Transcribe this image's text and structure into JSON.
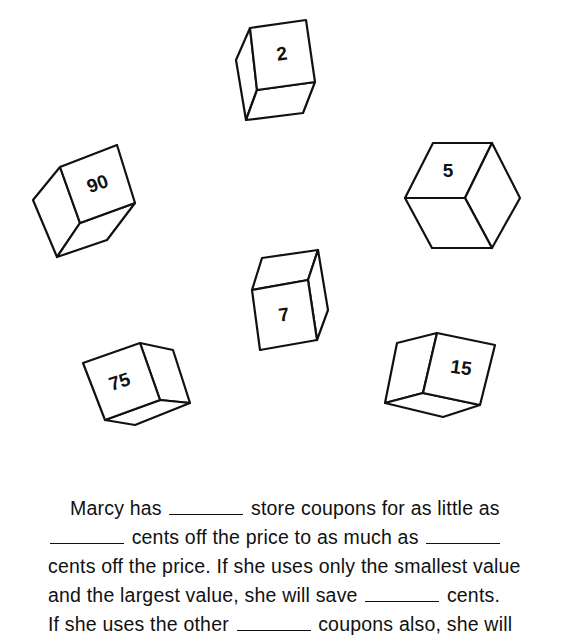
{
  "worksheet": {
    "coupon_cubes": [
      {
        "id": "cube-2",
        "value": "2"
      },
      {
        "id": "cube-90",
        "value": "90"
      },
      {
        "id": "cube-5",
        "value": "5"
      },
      {
        "id": "cube-7",
        "value": "7"
      },
      {
        "id": "cube-75",
        "value": "75"
      },
      {
        "id": "cube-15",
        "value": "15"
      }
    ],
    "passage": {
      "line1": {
        "a": "Marcy has",
        "b": "store coupons for as little as"
      },
      "line2": {
        "a": "cents off the price to as much as"
      },
      "line3": {
        "a": "cents off the price. If she uses only the smallest value"
      },
      "line4": {
        "a": "and the largest value, she will save",
        "b": "cents."
      },
      "line5": {
        "a": "If she uses the other",
        "b": "coupons also, she will"
      }
    },
    "answer_blanks": [
      "",
      "",
      "",
      "",
      ""
    ]
  }
}
